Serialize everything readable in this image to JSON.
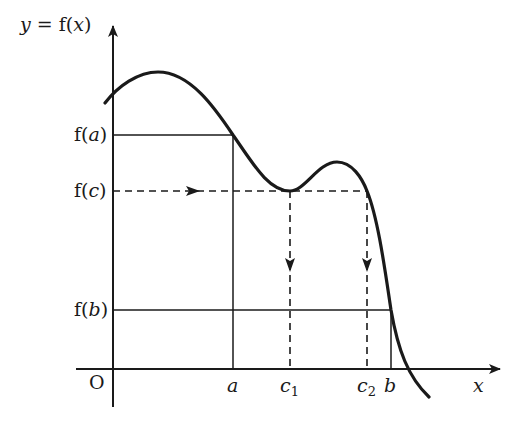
{
  "diagram": {
    "y_axis_label": "y = f(x)",
    "x_axis_label": "x",
    "origin_label": "O",
    "y_labels": {
      "fa": "f(a)",
      "fc": "f(c)",
      "fb": "f(b)"
    },
    "x_labels": {
      "a": "a",
      "c1": "c",
      "c1_sub": "1",
      "c2": "c",
      "c2_sub": "2",
      "b": "b"
    },
    "colors": {
      "line": "#1a1a1a",
      "background": "#ffffff"
    }
  }
}
